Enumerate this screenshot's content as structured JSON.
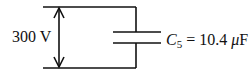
{
  "diagram": {
    "type": "circuit",
    "voltage_label": "300 V",
    "capacitor": {
      "symbol": "C",
      "subscript": "5",
      "equals": "=",
      "value": "10.4",
      "unit_prefix": "μ",
      "unit": "F"
    },
    "colors": {
      "wire": "#111111",
      "background": "#ffffff"
    }
  }
}
